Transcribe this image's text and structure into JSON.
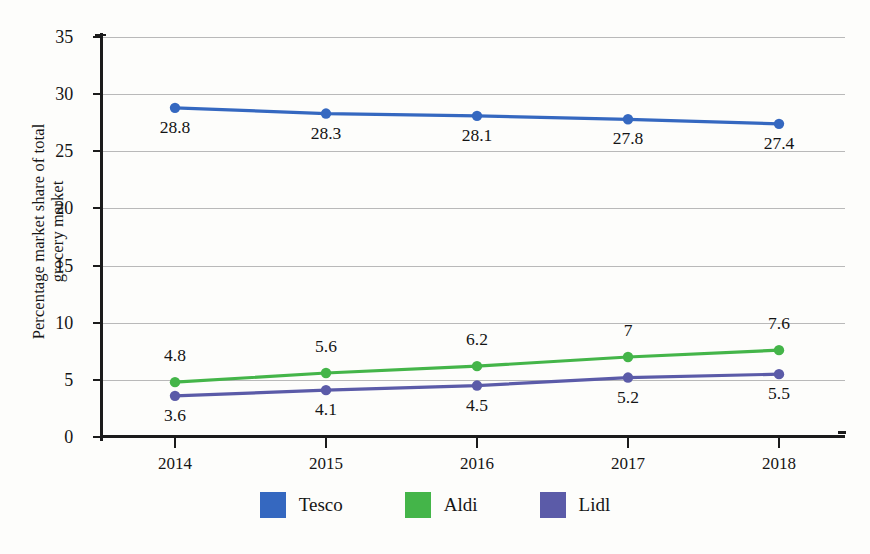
{
  "chart_data": {
    "type": "line",
    "title": "",
    "xlabel": "",
    "ylabel": "Percentage market share of total\ngrocery market",
    "categories": [
      "2014",
      "2015",
      "2016",
      "2017",
      "2018"
    ],
    "ylim": [
      0,
      35
    ],
    "yticks": [
      "0",
      "5",
      "10",
      "15",
      "20",
      "25",
      "30",
      "35"
    ],
    "grid": true,
    "legend_position": "bottom",
    "series": [
      {
        "name": "Tesco",
        "color": "#3568c0",
        "values": [
          28.8,
          28.3,
          28.1,
          27.8,
          27.4
        ],
        "labels": [
          "28.8",
          "28.3",
          "28.1",
          "27.8",
          "27.4"
        ],
        "label_side": "below"
      },
      {
        "name": "Aldi",
        "color": "#44b549",
        "values": [
          4.8,
          5.6,
          6.2,
          7,
          7.6
        ],
        "labels": [
          "4.8",
          "5.6",
          "6.2",
          "7",
          "7.6"
        ],
        "label_side": "above"
      },
      {
        "name": "Lidl",
        "color": "#5b5ba8",
        "values": [
          3.6,
          4.1,
          4.5,
          5.2,
          5.5
        ],
        "labels": [
          "3.6",
          "4.1",
          "4.5",
          "5.2",
          "5.5"
        ],
        "label_side": "below"
      }
    ]
  }
}
